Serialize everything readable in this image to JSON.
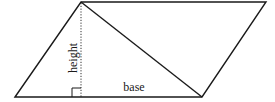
{
  "diagram": {
    "type": "parallelogram-with-diagonal",
    "labels": {
      "height": "height",
      "base": "base"
    },
    "colors": {
      "stroke": "#1a1a1a",
      "background": "#ffffff"
    },
    "vertices": {
      "bottom_left": [
        15,
        97
      ],
      "top_left": [
        81,
        2
      ],
      "top_right": [
        266,
        2
      ],
      "bottom_right": [
        202,
        97
      ]
    },
    "features": [
      "diagonal from top-left to bottom-right",
      "dotted height line",
      "right-angle marker"
    ]
  }
}
